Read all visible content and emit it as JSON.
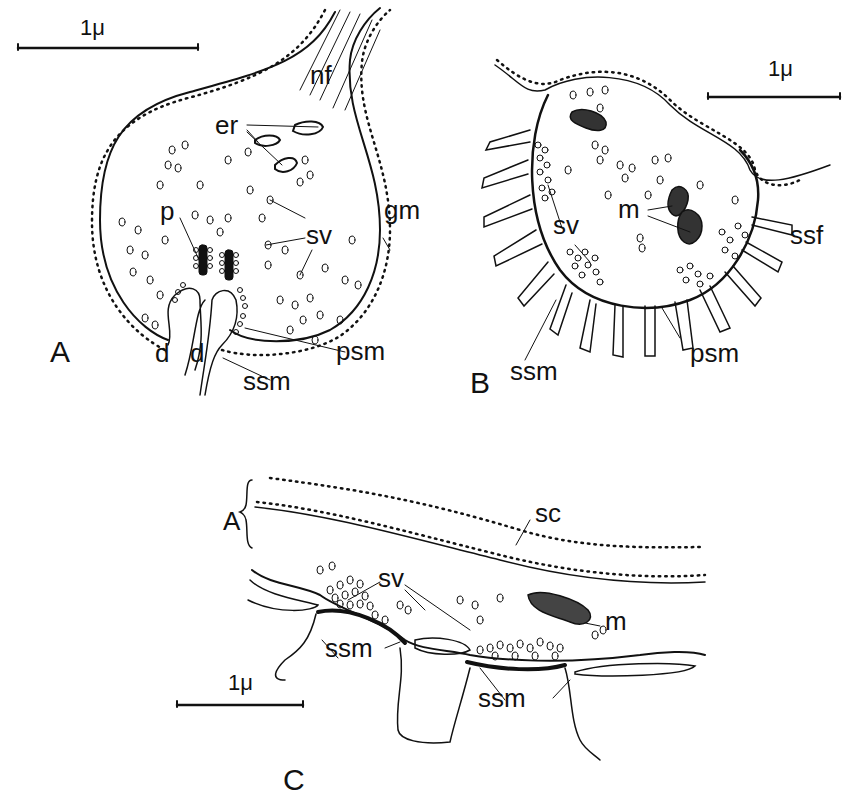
{
  "figure": {
    "panels": [
      {
        "id": "A",
        "panel_label": "A",
        "scale_bar": "1μ",
        "labels": {
          "nf": "nf",
          "er": "er",
          "p": "p",
          "sv": "sv",
          "gm": "gm",
          "d1": "d",
          "d2": "d",
          "ssm": "ssm",
          "psm": "psm"
        }
      },
      {
        "id": "B",
        "panel_label": "B",
        "scale_bar": "1μ",
        "labels": {
          "sv": "sv",
          "m": "m",
          "ssf": "ssf",
          "ssm": "ssm",
          "psm": "psm"
        }
      },
      {
        "id": "C",
        "panel_label": "C",
        "scale_bar": "1μ",
        "labels": {
          "a_bracket": "A",
          "sc": "sc",
          "sv": "sv",
          "m": "m",
          "ssm1": "ssm",
          "ssm2": "ssm"
        }
      }
    ]
  },
  "colors": {
    "ink": "#111111",
    "paper": "#ffffff"
  }
}
